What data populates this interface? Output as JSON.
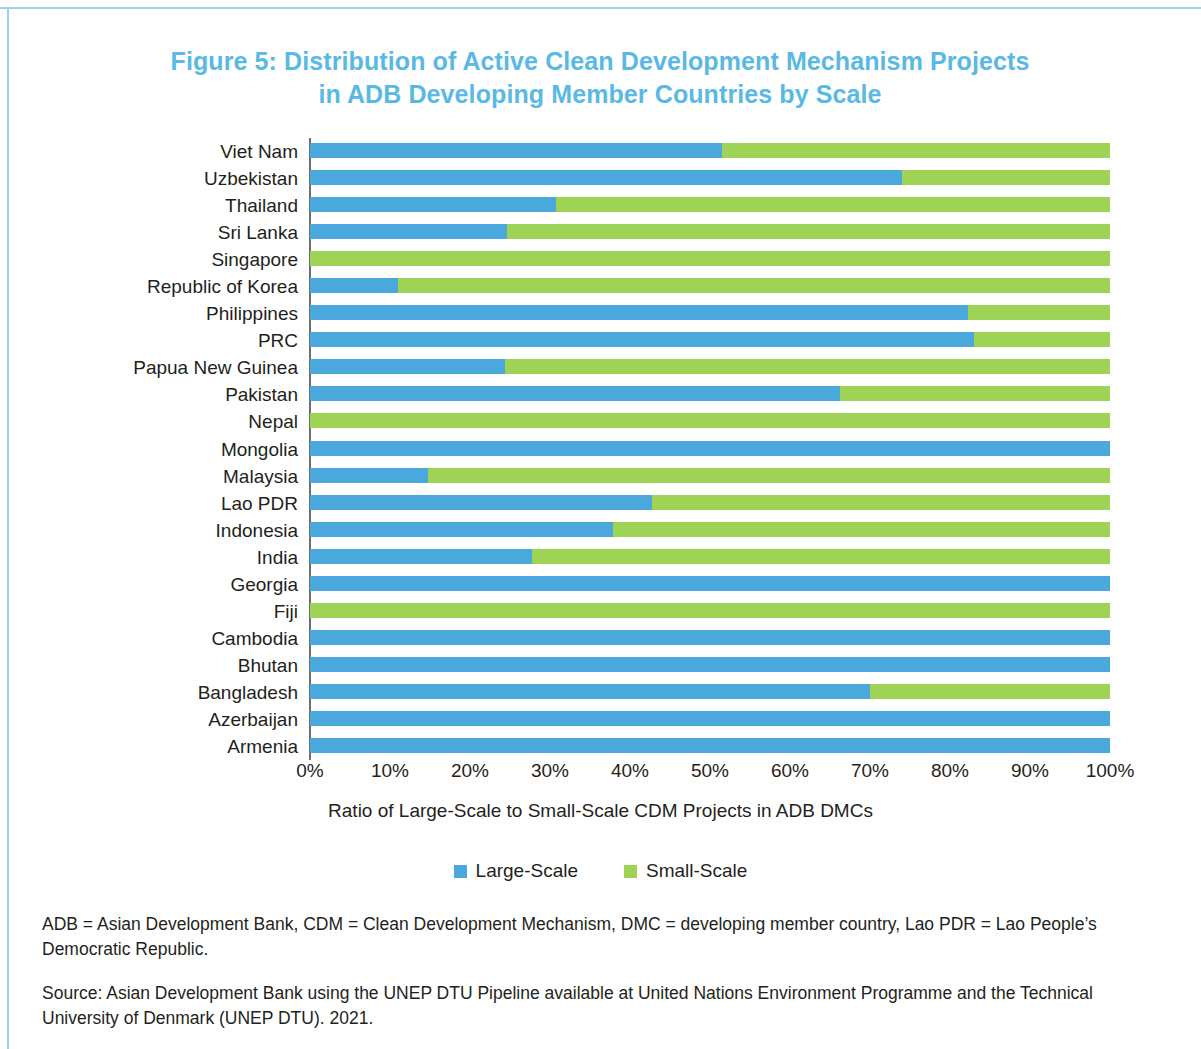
{
  "figure": {
    "title_line1": "Figure 5: Distribution of Active Clean Development Mechanism Projects",
    "title_line2": "in ADB Developing Member Countries by Scale",
    "title_color": "#5ab9e4"
  },
  "legend": {
    "large_label": "Large-Scale",
    "small_label": "Small-Scale",
    "large_color": "#4aa8dc",
    "small_color": "#9fd356"
  },
  "axis": {
    "xlabel": "Ratio of Large-Scale to Small-Scale CDM Projects in ADB DMCs",
    "ticks": [
      "0%",
      "10%",
      "20%",
      "30%",
      "40%",
      "50%",
      "60%",
      "70%",
      "80%",
      "90%",
      "100%"
    ]
  },
  "notes": {
    "abbreviations": "ADB = Asian Development Bank, CDM = Clean Development Mechanism, DMC = developing member country, Lao PDR = Lao People’s Democratic Republic.",
    "source": "Source: Asian Development Bank using the UNEP DTU Pipeline available at United Nations Environment Programme and the Technical University of Denmark (UNEP DTU). 2021."
  },
  "chart_data": {
    "type": "bar",
    "orientation": "horizontal",
    "stacked": true,
    "stack_total": 100,
    "title": "Figure 5: Distribution of Active Clean Development Mechanism Projects in ADB Developing Member Countries by Scale",
    "xlabel": "Ratio of Large-Scale to Small-Scale CDM Projects in ADB DMCs",
    "ylabel": "",
    "xlim": [
      0,
      100
    ],
    "xticks": [
      0,
      10,
      20,
      30,
      40,
      50,
      60,
      70,
      80,
      90,
      100
    ],
    "xtick_labels": [
      "0%",
      "10%",
      "20%",
      "30%",
      "40%",
      "50%",
      "60%",
      "70%",
      "80%",
      "90%",
      "100%"
    ],
    "grid": false,
    "legend_position": "bottom",
    "categories": [
      "Viet Nam",
      "Uzbekistan",
      "Thailand",
      "Sri Lanka",
      "Singapore",
      "Republic of Korea",
      "Philippines",
      "PRC",
      "Papua New Guinea",
      "Pakistan",
      "Nepal",
      "Mongolia",
      "Malaysia",
      "Lao PDR",
      "Indonesia",
      "India",
      "Georgia",
      "Fiji",
      "Cambodia",
      "Bhutan",
      "Bangladesh",
      "Azerbaijan",
      "Armenia"
    ],
    "series": [
      {
        "name": "Large-Scale",
        "color": "#4aa8dc",
        "values": [
          51.5,
          74,
          30.8,
          24.6,
          0,
          11,
          82.3,
          83,
          24.4,
          66.3,
          0,
          100,
          14.8,
          42.8,
          37.9,
          27.8,
          100,
          0,
          100,
          100,
          70,
          100,
          100
        ]
      },
      {
        "name": "Small-Scale",
        "color": "#9fd356",
        "values": [
          48.5,
          26,
          69.2,
          75.4,
          100,
          89,
          17.7,
          17,
          75.6,
          33.7,
          100,
          0,
          85.2,
          57.2,
          62.1,
          72.2,
          0,
          100,
          0,
          0,
          30,
          0,
          0
        ]
      }
    ]
  }
}
